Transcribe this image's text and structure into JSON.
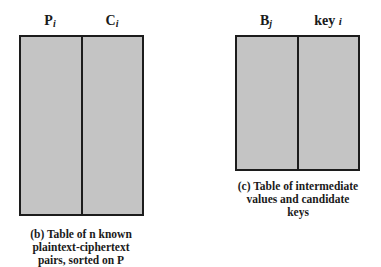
{
  "table_b": {
    "columns": [
      {
        "name": "P",
        "subscript": "i"
      },
      {
        "name": "C",
        "subscript": "i"
      }
    ],
    "caption_lines": [
      "(b) Table of n known",
      "plaintext-ciphertext",
      "pairs, sorted on P"
    ]
  },
  "table_c": {
    "columns": [
      {
        "name": "B",
        "subscript": "j"
      },
      {
        "name": "key",
        "subscript": "i"
      }
    ],
    "caption_lines": [
      "(c) Table of intermediate",
      "values and candidate",
      "keys"
    ]
  },
  "colors": {
    "fill": "#c4c4c4",
    "border": "#1c1c1c"
  }
}
